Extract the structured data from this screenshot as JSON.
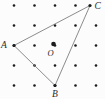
{
  "diagram": {
    "background": "#fcfcfc",
    "dot_color": "#1c1c1c",
    "line_color": "#6e6e6e",
    "label_color": "#2a2a2a",
    "grid": {
      "cols": 5,
      "rows": 5,
      "x0": 14,
      "y0": 5.5,
      "dx": 20.5,
      "dy": 20,
      "dot_radius": 1.3,
      "skip": [
        [
          4,
          0
        ]
      ]
    },
    "triangle": {
      "stroke_width": 0.8,
      "vertex_dot_radius": 1.6,
      "vertices": {
        "A": {
          "x": 14,
          "y": 45.5
        },
        "B": {
          "x": 55,
          "y": 85.5
        },
        "C": {
          "x": 90,
          "y": 5.5
        }
      },
      "edges": [
        [
          "A",
          "B"
        ],
        [
          "B",
          "C"
        ],
        [
          "C",
          "A"
        ]
      ]
    },
    "center_point": {
      "x": 53.5,
      "y": 44,
      "radius": 2.3
    },
    "labels": {
      "A": {
        "text": "A",
        "x": 1,
        "y": 48,
        "anchor": "start",
        "size": 9.5
      },
      "B": {
        "text": "B",
        "x": 55,
        "y": 97,
        "anchor": "middle",
        "size": 9.5
      },
      "C": {
        "text": "C",
        "x": 94.5,
        "y": 8.5,
        "anchor": "start",
        "size": 9.5
      },
      "O": {
        "text": "O",
        "x": 47.5,
        "y": 56,
        "anchor": "start",
        "size": 8.5
      }
    }
  }
}
